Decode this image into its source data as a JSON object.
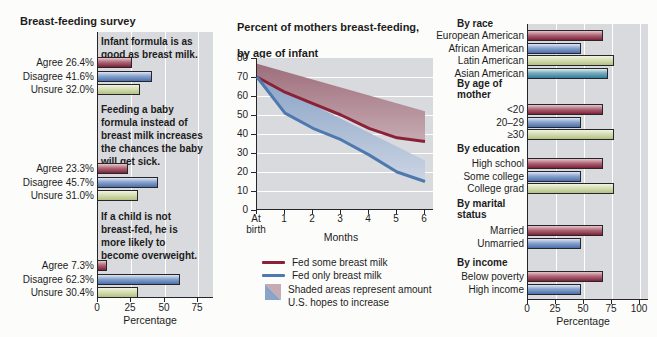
{
  "palette": {
    "plot_bg": "#d9dade",
    "red_line": "#8b2136",
    "blue_line": "#4d79af",
    "red_band_dark": "#9d6e7b",
    "red_band_light": "#c7abb2",
    "blue_band_dark": "#8aa3c6",
    "blue_band_light": "#ccd5e4",
    "bar_red": "#7e2039",
    "bar_blue": "#4a70ad",
    "bar_green": "#b2c184",
    "bar_teal": "#2f7f9e"
  },
  "chart_data": [
    {
      "type": "bar",
      "title": "Breast-feeding survey",
      "xlabel": "Percentage",
      "xlim": [
        0,
        75
      ],
      "x_ticks": [
        0,
        25,
        50,
        75
      ],
      "orientation": "horizontal",
      "groups": [
        {
          "question": "Infant formula is as good as breast milk.",
          "question_lines": "Infant formula is as\ngood as breast milk.",
          "bars": [
            {
              "label": "Agree 26.4%",
              "value": 26.4,
              "color": "red"
            },
            {
              "label": "Disagree 41.6%",
              "value": 41.6,
              "color": "blue"
            },
            {
              "label": "Unsure 32.0%",
              "value": 32.0,
              "color": "green"
            }
          ]
        },
        {
          "question": "Feeding a baby formula instead of breast milk increases the chances the baby will get sick.",
          "question_lines": "Feeding a baby\nformula instead of\nbreast milk increases\nthe chances the baby\nwill get sick.",
          "bars": [
            {
              "label": "Agree 23.3%",
              "value": 23.3,
              "color": "red"
            },
            {
              "label": "Disagree 45.7%",
              "value": 45.7,
              "color": "blue"
            },
            {
              "label": "Unsure 31.0%",
              "value": 31.0,
              "color": "green"
            }
          ]
        },
        {
          "question": "If a child is not breast-fed, he is more likely to become overweight.",
          "question_lines": "If a child is not\nbreast-fed, he is\nmore likely to\nbecome overweight.",
          "bars": [
            {
              "label": "Agree 7.3%",
              "value": 7.3,
              "color": "red"
            },
            {
              "label": "Disagree 62.3%",
              "value": 62.3,
              "color": "blue"
            },
            {
              "label": "Unsure 30.4%",
              "value": 30.4,
              "color": "green"
            }
          ]
        }
      ]
    },
    {
      "type": "line",
      "title": "Percent of mothers breast-feeding, by age of infant",
      "title_lines": [
        "Percent of mothers breast-feeding,",
        "by age of infant"
      ],
      "xlabel": "Months",
      "x": [
        0,
        1,
        2,
        3,
        4,
        5,
        6
      ],
      "x_tick_labels": [
        "At\nbirth",
        "1",
        "2",
        "3",
        "4",
        "5",
        "6"
      ],
      "ylim": [
        0,
        80
      ],
      "y_ticks": [
        0,
        10,
        20,
        30,
        40,
        50,
        60,
        70,
        80
      ],
      "grid": "horizontal",
      "series": [
        {
          "name": "Fed some breast milk",
          "color": "#8b2136",
          "values": [
            70,
            62,
            56,
            50,
            43,
            38,
            36
          ]
        },
        {
          "name": "Fed only breast milk",
          "color": "#4d79af",
          "values": [
            70,
            51,
            43,
            37,
            29,
            20,
            15
          ]
        }
      ],
      "shaded_areas": {
        "note_lines": [
          "Shaded areas represent amount",
          "U.S. hopes to increase"
        ],
        "red_target_line": {
          "x": [
            0,
            6
          ],
          "values": [
            77,
            52
          ]
        },
        "blue_target_line": {
          "x": [
            0,
            6
          ],
          "values": [
            70,
            26
          ]
        }
      },
      "legend_position": "below"
    },
    {
      "type": "bar",
      "title": "",
      "xlabel": "Percentage",
      "xlim": [
        0,
        100
      ],
      "x_ticks": [
        0,
        25,
        50,
        75,
        100
      ],
      "orientation": "horizontal",
      "groups": [
        {
          "header": "By race",
          "bars": [
            {
              "label": "European American",
              "value": 68,
              "color": "red"
            },
            {
              "label": "African American",
              "value": 48,
              "color": "blue"
            },
            {
              "label": "Latin American",
              "value": 78,
              "color": "green"
            },
            {
              "label": "Asian American",
              "value": 72,
              "color": "teal"
            }
          ]
        },
        {
          "header": "By age of\nmother",
          "bars": [
            {
              "label": "<20",
              "value": 68,
              "color": "red"
            },
            {
              "label": "20–29",
              "value": 48,
              "color": "blue"
            },
            {
              "label": "≥30",
              "value": 78,
              "color": "green"
            }
          ]
        },
        {
          "header": "By education",
          "bars": [
            {
              "label": "High school",
              "value": 68,
              "color": "red"
            },
            {
              "label": "Some college",
              "value": 48,
              "color": "blue"
            },
            {
              "label": "College grad",
              "value": 78,
              "color": "green"
            }
          ]
        },
        {
          "header": "By marital\nstatus",
          "bars": [
            {
              "label": "Married",
              "value": 68,
              "color": "red"
            },
            {
              "label": "Unmarried",
              "value": 48,
              "color": "blue"
            }
          ]
        },
        {
          "header": "By income",
          "bars": [
            {
              "label": "Below poverty",
              "value": 68,
              "color": "red"
            },
            {
              "label": "High income",
              "value": 48,
              "color": "blue"
            }
          ]
        }
      ]
    }
  ]
}
